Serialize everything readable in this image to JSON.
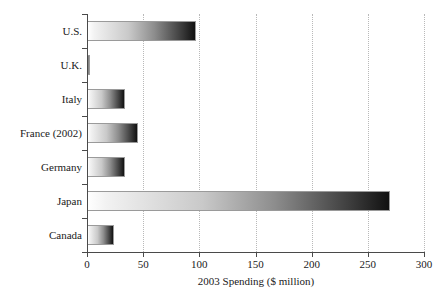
{
  "chart_data": {
    "type": "bar",
    "orientation": "horizontal",
    "title": "",
    "xlabel": "2003 Spending ($ million)",
    "ylabel": "",
    "categories": [
      "U.S.",
      "U.K.",
      "Italy",
      "France (2002)",
      "Germany",
      "Japan",
      "Canada"
    ],
    "values": [
      97,
      3,
      34,
      45,
      34,
      270,
      24
    ],
    "xlim": [
      0,
      300
    ],
    "xticks": [
      0,
      50,
      100,
      150,
      200,
      250,
      300
    ],
    "xtick_labels": [
      "0",
      "50",
      "100",
      "150",
      "200",
      "250",
      "300"
    ],
    "grid": "vertical-dotted",
    "legend": "none",
    "bar_fill": "linear-gradient-white-to-black",
    "colors": {
      "gradient_start": "#ffffff",
      "gradient_end": "#111111",
      "bar_border": "#9a9a9a",
      "axis": "#4a4a4a",
      "gridline": "#b9b9b9",
      "text": "#1a1a1a",
      "background": "#ffffff"
    }
  }
}
